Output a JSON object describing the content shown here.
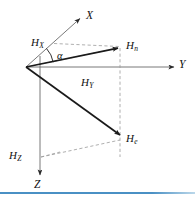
{
  "figure": {
    "kind": "3d-vector-decomposition-diagram",
    "background_color": "#ffffff",
    "line_color": "#1a1a1a",
    "dashed_color": "#8a8a8a",
    "axis_color": "#5a5a5a",
    "caption_rule_color": "#4a90c4",
    "caption_text_color": "#c9ccd1"
  },
  "axes": [
    {
      "id": "x",
      "label": "X",
      "sub": ""
    },
    {
      "id": "y",
      "label": "Y",
      "sub": ""
    },
    {
      "id": "z",
      "label": "Z",
      "sub": ""
    }
  ],
  "components": [
    {
      "id": "hx",
      "label": "H",
      "sub": "X"
    },
    {
      "id": "hy",
      "label": "H",
      "sub": "Y"
    },
    {
      "id": "hz",
      "label": "H",
      "sub": "Z"
    },
    {
      "id": "hn",
      "label": "H",
      "sub": "n"
    },
    {
      "id": "he",
      "label": "H",
      "sub": "e"
    }
  ],
  "angle": {
    "id": "alpha",
    "symbol": "α"
  },
  "caption": {
    "rule_visible": true,
    "text": ""
  },
  "geometry": {
    "origin": {
      "x": 26,
      "y": 67
    },
    "x_axis_tip": {
      "x": 82,
      "y": 17
    },
    "y_axis_tip": {
      "x": 176,
      "y": 67
    },
    "z_axis_tip": {
      "x": 40,
      "y": 177
    },
    "hn_tip": {
      "x": 120,
      "y": 47
    },
    "he_tip": {
      "x": 122,
      "y": 137
    },
    "hx_foot": {
      "x": 54,
      "y": 43
    },
    "hz_foot": {
      "x": 40,
      "y": 157
    }
  }
}
